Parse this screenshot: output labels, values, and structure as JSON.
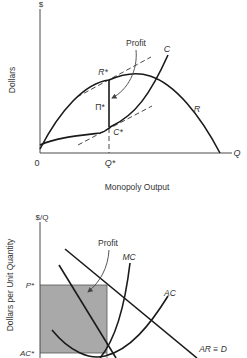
{
  "top_diagram": {
    "y_axis_symbol": "$",
    "y_axis_title": "Dollars",
    "x_axis_symbol": "Q",
    "x_axis_title": "Monopoly Output",
    "origin_label": "0",
    "q_star_label": "Q*",
    "r_star_label": "R*",
    "c_star_label": "C*",
    "pi_star_label": "Π*",
    "profit_label": "Profit",
    "revenue_curve_label": "R",
    "cost_curve_label": "C"
  },
  "bottom_diagram": {
    "y_axis_symbol": "$/Q",
    "y_axis_title": "Dollars per Unit Quantity",
    "p_star_label": "P*",
    "ac_star_label": "AC*",
    "profit_label": "Profit",
    "mc_label": "MC",
    "ac_label": "AC",
    "demand_label": "AR ≡ D",
    "profit_area_color": "#a9a9a9"
  }
}
